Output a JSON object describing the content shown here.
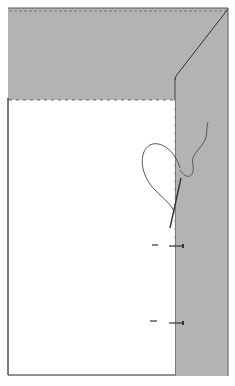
{
  "figure": {
    "colors": {
      "binding": "#b3b3b3",
      "fabric": "#ffffff",
      "outline": "#333333",
      "stitch": "#666666",
      "thread": "#555555"
    },
    "parts": {
      "binding_top": "binding-top-band",
      "binding_right": "binding-right-band",
      "miter": "miter-fold-line",
      "fabric_panel": "fabric-panel",
      "thread": "thread-loop",
      "needle": "needle",
      "pins": [
        "pin-upper",
        "pin-lower"
      ]
    }
  }
}
